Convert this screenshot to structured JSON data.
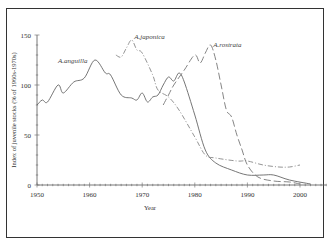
{
  "chart_data": {
    "type": "line",
    "title": "",
    "xlabel": "Year",
    "ylabel": "Index of juvenile stocks (% of 1960s-1970s)",
    "xlim": [
      1950,
      2005
    ],
    "ylim": [
      0,
      150
    ],
    "x_ticks": [
      "1950",
      "1960",
      "1970",
      "1980",
      "1990",
      "2000"
    ],
    "y_ticks": [
      "0",
      "50",
      "100",
      "150"
    ],
    "grid": false,
    "legend": "inline labels",
    "series": [
      {
        "name": "A.anguilla",
        "style": "solid",
        "color": "#666666",
        "x": [
          1950,
          1951,
          1952,
          1954,
          1955,
          1957,
          1959,
          1961,
          1963,
          1964,
          1966,
          1968,
          1969,
          1970,
          1971,
          1972,
          1973,
          1974,
          1975,
          1976,
          1977,
          1978,
          1980,
          1982,
          1984,
          1987,
          1990,
          1993,
          1995,
          1998,
          2002
        ],
        "values": [
          80,
          85,
          83,
          100,
          92,
          103,
          107,
          125,
          112,
          110,
          90,
          87,
          85,
          92,
          83,
          88,
          90,
          100,
          108,
          104,
          112,
          103,
          70,
          35,
          22,
          15,
          10,
          10,
          10,
          5,
          1
        ]
      },
      {
        "name": "A.japonica",
        "style": "dash-dot",
        "color": "#888888",
        "x": [
          1965,
          1966,
          1967,
          1968,
          1969,
          1970,
          1972,
          1973,
          1975,
          1977,
          1980,
          1982,
          1984,
          1988,
          1990,
          1993,
          1996,
          1998,
          2000
        ],
        "values": [
          130,
          128,
          137,
          145,
          135,
          132,
          110,
          95,
          88,
          75,
          48,
          30,
          27,
          24,
          24,
          20,
          18,
          18,
          20
        ]
      },
      {
        "name": "A.rostrata",
        "style": "long-dash",
        "color": "#777777",
        "x": [
          1974,
          1975,
          1976,
          1978,
          1980,
          1981,
          1982,
          1983,
          1984,
          1985,
          1986,
          1987,
          1988,
          1989,
          1990,
          1992,
          1995,
          1998,
          2000
        ],
        "values": [
          80,
          90,
          100,
          115,
          130,
          122,
          132,
          140,
          125,
          100,
          75,
          68,
          50,
          35,
          20,
          8,
          4,
          3,
          1
        ]
      }
    ],
    "annotations": [
      {
        "text": "A.anguilla",
        "x": 1954,
        "y": 122
      },
      {
        "text": "A.japonica",
        "x": 1968.5,
        "y": 146
      },
      {
        "text": "A.rostrata",
        "x": 1983.5,
        "y": 138
      }
    ]
  }
}
